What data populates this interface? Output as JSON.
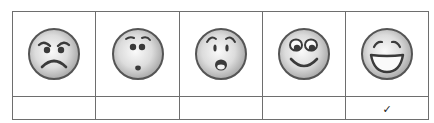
{
  "scale": {
    "faces": [
      {
        "id": "angry",
        "label": "angry-face"
      },
      {
        "id": "surprised-small",
        "label": "puzzled-face"
      },
      {
        "id": "shocked",
        "label": "shocked-face"
      },
      {
        "id": "happy",
        "label": "happy-face"
      },
      {
        "id": "very-happy",
        "label": "laughing-face"
      }
    ],
    "selections": [
      "",
      "",
      "",
      "",
      "✓"
    ],
    "selected_index": 4
  },
  "colors": {
    "border": "#6e6e6e",
    "face_outline": "#555555",
    "face_fill_center": "#fafafa",
    "face_fill_edge": "#a8a8a8",
    "feature": "#3a3a3a"
  }
}
